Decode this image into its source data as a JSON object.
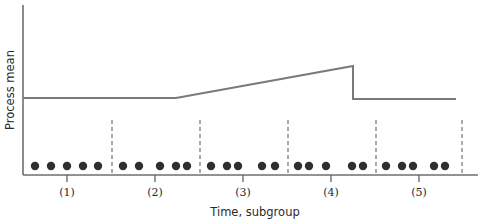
{
  "diagram": {
    "y_axis_label": "Process mean",
    "x_axis_label": "Time, subgroup",
    "subgroups": [
      {
        "label": "(1)",
        "tick_x": 67,
        "dots_x": [
          35,
          51,
          67,
          83,
          98
        ]
      },
      {
        "label": "(2)",
        "tick_x": 155,
        "dots_x": [
          123,
          139,
          160,
          176,
          187
        ]
      },
      {
        "label": "(3)",
        "tick_x": 243,
        "dots_x": [
          211,
          227,
          238,
          262,
          275
        ]
      },
      {
        "label": "(4)",
        "tick_x": 331,
        "dots_x": [
          298,
          309,
          326,
          352,
          363
        ]
      },
      {
        "label": "(5)",
        "tick_x": 419,
        "dots_x": [
          386,
          402,
          413,
          434,
          445
        ]
      }
    ],
    "dividers_x": [
      112,
      200,
      288,
      376,
      462
    ],
    "process_mean_path": [
      [
        23,
        98
      ],
      [
        176,
        98
      ],
      [
        353,
        66
      ],
      [
        353,
        99
      ],
      [
        456,
        99
      ]
    ],
    "colors": {
      "axis": "#6e6e6e",
      "mean_line": "#7a7a7a",
      "dots": "#2f2f2f",
      "dividers": "#555555"
    }
  }
}
